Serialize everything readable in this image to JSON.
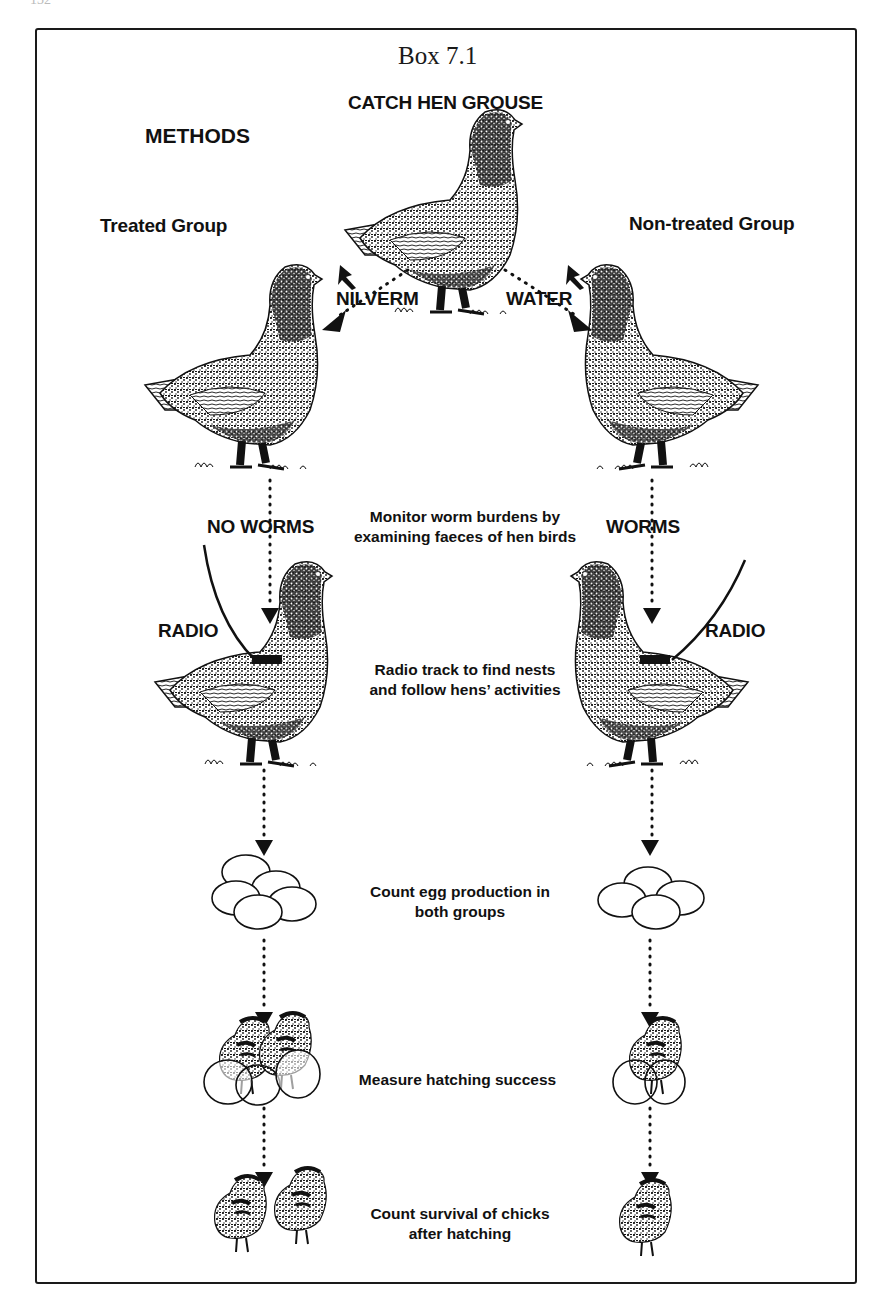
{
  "page": {
    "number": "132"
  },
  "box": {
    "title": "Box 7.1",
    "heading": "CATCH HEN GROUSE",
    "section": "METHODS",
    "groups": {
      "treated": "Treated Group",
      "non_treated": "Non-treated Group"
    },
    "treatments": {
      "treated": "NILVERM",
      "non_treated": "WATER"
    },
    "worm_status": {
      "treated": "NO WORMS",
      "non_treated": "WORMS"
    },
    "radio_labels": {
      "treated": "RADIO",
      "non_treated": "RADIO"
    },
    "steps": [
      {
        "id": "monitor",
        "line1": "Monitor worm burdens by",
        "line2": "examining faeces of hen birds"
      },
      {
        "id": "radio",
        "line1": "Radio track to find nests",
        "line2": "and follow hens’ activities"
      },
      {
        "id": "eggs",
        "line1": "Count egg production in",
        "line2": "both groups"
      },
      {
        "id": "hatching",
        "line1": "Measure hatching success",
        "line2": ""
      },
      {
        "id": "chicks",
        "line1": "Count survival of chicks",
        "line2": "after hatching"
      }
    ],
    "illustrations": {
      "treated": {
        "eggs": 5,
        "hatching_chicks": 2,
        "surviving_chicks": 2
      },
      "non_treated": {
        "eggs": 4,
        "hatching_chicks": 1,
        "surviving_chicks": 1
      }
    }
  }
}
